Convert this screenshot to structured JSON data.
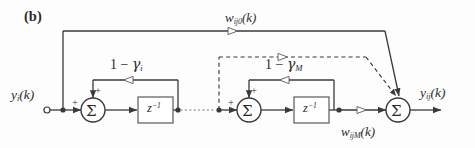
{
  "figure": {
    "panel_tag": "(b)",
    "kind": "signal-flow-block-diagram"
  },
  "labels": {
    "input_signal": "y",
    "input_signal_sub": "i",
    "input_signal_tail": "(k)",
    "output_signal": "y",
    "output_signal_sub": "ij",
    "output_signal_tail": "(k)",
    "weight_first": "w",
    "weight_first_sub": "ij0",
    "weight_first_tail": "(k)",
    "weight_last": "w",
    "weight_last_sub": "ijM",
    "weight_last_tail": "(k)",
    "gain_first_prefix": "1 − ",
    "gain_first_symbol": "γ",
    "gain_first_sub": "i",
    "gain_last_prefix": "1 − ",
    "gain_last_symbol": "γ",
    "gain_last_sub": "M",
    "delay_block": "z",
    "delay_block_exp": "−1",
    "adder_glyph": "Σ",
    "plus": "+"
  },
  "nodes": [
    {
      "name": "input-terminal",
      "shape": "open-circle",
      "x": 47,
      "y": 110
    },
    {
      "name": "input-tap-junction",
      "shape": "filled-dot",
      "x": 63,
      "y": 110
    },
    {
      "name": "stage1-adder",
      "shape": "circle-sigma",
      "x": 93,
      "y": 110
    },
    {
      "name": "stage1-delay",
      "shape": "square-box",
      "x": 155,
      "y": 110
    },
    {
      "name": "stage1-out-junction",
      "shape": "filled-dot",
      "x": 178,
      "y": 110
    },
    {
      "name": "stageM-in-junction",
      "shape": "filled-dot",
      "x": 219,
      "y": 110
    },
    {
      "name": "stageM-adder",
      "shape": "circle-sigma",
      "x": 249,
      "y": 110
    },
    {
      "name": "stageM-delay",
      "shape": "square-box",
      "x": 311,
      "y": 110
    },
    {
      "name": "stageM-out-junction",
      "shape": "filled-dot",
      "x": 339,
      "y": 110
    },
    {
      "name": "output-adder",
      "shape": "circle-sigma",
      "x": 398,
      "y": 110
    },
    {
      "name": "output-terminal",
      "shape": "arrow-end",
      "x": 440,
      "y": 110
    }
  ],
  "edges": [
    {
      "name": "input-to-stage1",
      "style": "solid",
      "arrow": "filled"
    },
    {
      "name": "stage1-feedback-gain",
      "style": "solid",
      "arrow": "hollow",
      "label": "1 − gamma_i"
    },
    {
      "name": "stage1-to-stageM-ellipsis",
      "style": "dotted",
      "arrow": "none"
    },
    {
      "name": "stageM-feedback-gain",
      "style": "solid",
      "arrow": "hollow",
      "label": "1 − gamma_M"
    },
    {
      "name": "tap0-to-output",
      "style": "solid",
      "arrow": "hollow",
      "label": "w_ij0(k)"
    },
    {
      "name": "tapM-to-output",
      "style": "solid",
      "arrow": "hollow",
      "label": "w_ijM(k)"
    },
    {
      "name": "intermediate-tap-to-output",
      "style": "dashed",
      "arrow": "hollow"
    }
  ],
  "colors": {
    "background": "#fdfdfd",
    "line": "#3a3a3a",
    "line_light": "#6e6e6e",
    "text": "#2b2b2b"
  }
}
